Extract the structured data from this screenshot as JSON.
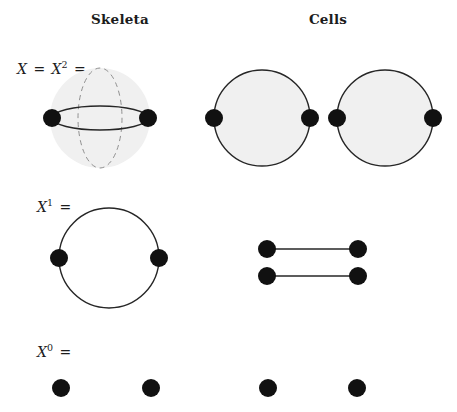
{
  "figure": {
    "width": 457,
    "height": 412,
    "background": "#ffffff",
    "stroke_color": "#262626",
    "dot_color": "#111111",
    "fill_color": "#f0f0f0",
    "dashed_color": "#8c8c8c"
  },
  "headers": {
    "skeleta": "Skeleta",
    "cells": "Cells"
  },
  "row_labels": {
    "row2": {
      "lhs": "X",
      "equals": "=",
      "rhs": "X",
      "exponent": "2",
      "trailing_equals": "=",
      "full": "X = X2 ="
    },
    "row1": {
      "base": "X",
      "exponent": "1",
      "trailing_equals": "=",
      "full": "X1 ="
    },
    "row0": {
      "base": "X",
      "exponent": "0",
      "trailing_equals": "=",
      "full": "X0 ="
    }
  },
  "diagram": {
    "rows": [
      {
        "name": "two-skeleton",
        "label": "X = X2 =",
        "skeleton": {
          "shape": "sphere-with-lens",
          "sphere": {
            "cx": 100,
            "cy": 118,
            "r": 50,
            "filled": true
          },
          "dashed_meridian": {
            "cx": 100,
            "cy": 118,
            "rx": 22,
            "ry": 50
          },
          "lens": {
            "cx": 100,
            "cy": 118,
            "rx": 48,
            "ry": 12
          },
          "vertices": [
            {
              "cx": 52,
              "cy": 118,
              "r": 9
            },
            {
              "cx": 148,
              "cy": 118,
              "r": 9
            }
          ]
        },
        "cells": [
          {
            "shape": "disk",
            "cx": 262,
            "cy": 118,
            "r": 48,
            "filled": true,
            "vertices": [
              {
                "cx": 214,
                "cy": 118,
                "r": 9
              },
              {
                "cx": 310,
                "cy": 118,
                "r": 9
              }
            ]
          },
          {
            "shape": "disk",
            "cx": 385,
            "cy": 118,
            "r": 48,
            "filled": true,
            "vertices": [
              {
                "cx": 337,
                "cy": 118,
                "r": 9
              },
              {
                "cx": 433,
                "cy": 118,
                "r": 9
              }
            ]
          }
        ]
      },
      {
        "name": "one-skeleton",
        "label": "X1 =",
        "skeleton": {
          "shape": "circle-two-vertices",
          "circle": {
            "cx": 109,
            "cy": 258,
            "r": 50,
            "filled": false
          },
          "vertices": [
            {
              "cx": 59,
              "cy": 258,
              "r": 9
            },
            {
              "cx": 159,
              "cy": 258,
              "r": 9
            }
          ]
        },
        "cells": [
          {
            "shape": "edge",
            "x1": 267,
            "y1": 249,
            "x2": 358,
            "y2": 249,
            "vertices": [
              {
                "cx": 267,
                "cy": 249,
                "r": 9
              },
              {
                "cx": 358,
                "cy": 249,
                "r": 9
              }
            ]
          },
          {
            "shape": "edge",
            "x1": 267,
            "y1": 276,
            "x2": 358,
            "y2": 276,
            "vertices": [
              {
                "cx": 267,
                "cy": 276,
                "r": 9
              },
              {
                "cx": 358,
                "cy": 276,
                "r": 9
              }
            ]
          }
        ]
      },
      {
        "name": "zero-skeleton",
        "label": "X0 =",
        "skeleton": {
          "shape": "two-points",
          "vertices": [
            {
              "cx": 61,
              "cy": 388,
              "r": 9
            },
            {
              "cx": 151,
              "cy": 388,
              "r": 9
            }
          ]
        },
        "cells": [
          {
            "shape": "point",
            "vertices": [
              {
                "cx": 268,
                "cy": 388,
                "r": 9
              }
            ]
          },
          {
            "shape": "point",
            "vertices": [
              {
                "cx": 357,
                "cy": 388,
                "r": 9
              }
            ]
          }
        ]
      }
    ]
  }
}
